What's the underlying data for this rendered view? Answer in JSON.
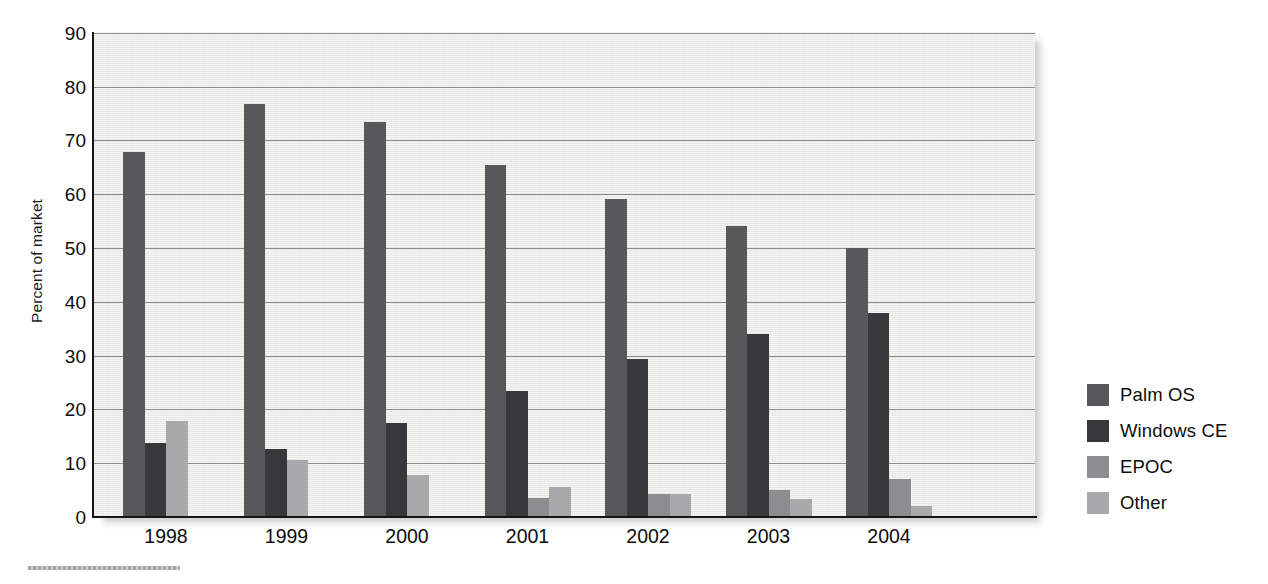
{
  "chart_data": {
    "type": "bar",
    "title": "",
    "xlabel": "",
    "ylabel": "Percent of market",
    "categories": [
      "1998",
      "1999",
      "2000",
      "2001",
      "2002",
      "2003",
      "2004"
    ],
    "ylim": [
      0,
      90
    ],
    "ytick_step": 10,
    "yticks": [
      "90",
      "80",
      "70",
      "60",
      "50",
      "40",
      "30",
      "20",
      "10",
      "0"
    ],
    "grid": true,
    "grid_axis": "y",
    "legend_position": "right",
    "series": [
      {
        "name": "Palm OS",
        "color": "#58585a",
        "values": [
          67.9,
          76.7,
          73.5,
          65.4,
          59.2,
          54.1,
          50.0
        ]
      },
      {
        "name": "Windows CE",
        "color": "#38383a",
        "values": [
          13.8,
          12.6,
          17.5,
          23.4,
          29.4,
          34.0,
          38.0
        ]
      },
      {
        "name": "EPOC",
        "color": "#8d8d8f",
        "values": [
          null,
          null,
          null,
          3.5,
          4.2,
          5.0,
          7.0
        ]
      },
      {
        "name": "Other",
        "color": "#a9a9ab",
        "values": [
          17.9,
          10.6,
          7.8,
          5.5,
          4.3,
          3.3,
          2.0
        ]
      }
    ]
  },
  "axes": {
    "y_title": "Percent of market"
  },
  "legend": {
    "items": [
      {
        "label": "Palm OS",
        "color": "#58585a"
      },
      {
        "label": "Windows CE",
        "color": "#38383a"
      },
      {
        "label": "EPOC",
        "color": "#8d8d8f"
      },
      {
        "label": "Other",
        "color": "#a9a9ab"
      }
    ]
  }
}
